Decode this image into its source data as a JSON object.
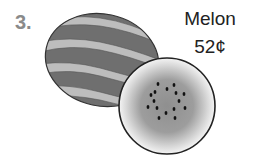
{
  "item": {
    "number": "3.",
    "name": "Melon",
    "price": "52¢"
  },
  "illustration": {
    "whole": "whole-watermelon",
    "slice": "watermelon-slice"
  },
  "colors": {
    "number": "#8a8a8a",
    "text": "#222222",
    "rind_dark": "#6e6e6e",
    "rind_light": "#bdbdbd",
    "flesh": "#9a9a9a",
    "seed": "#111111"
  }
}
